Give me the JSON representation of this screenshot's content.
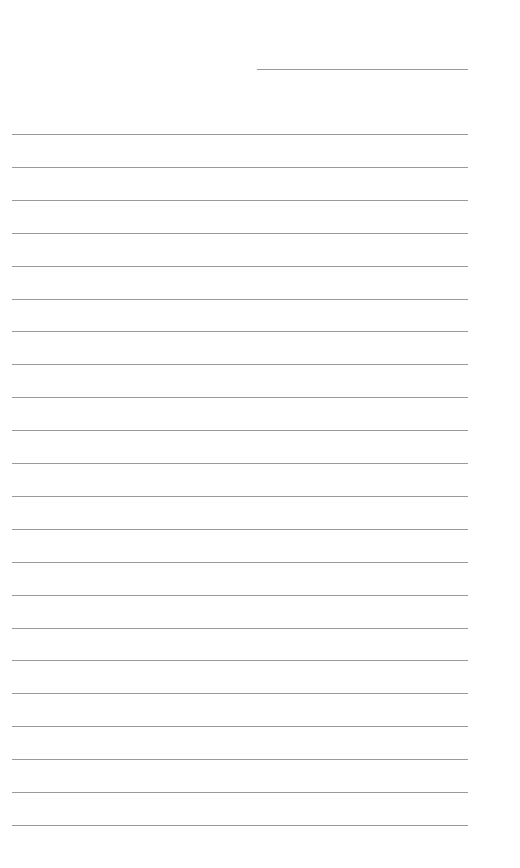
{
  "page": {
    "type": "lined-paper",
    "header_line": {
      "label": ""
    },
    "ruled_lines_count": 22,
    "line_color": "#9a9a9a",
    "background": "#ffffff"
  }
}
